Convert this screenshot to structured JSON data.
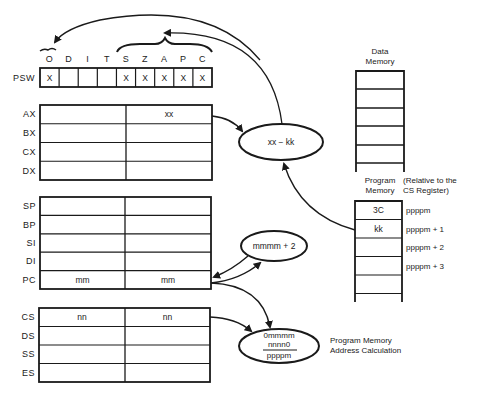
{
  "psw": {
    "label": "PSW",
    "flags": [
      {
        "name": "O",
        "value": "X"
      },
      {
        "name": "D",
        "value": ""
      },
      {
        "name": "I",
        "value": ""
      },
      {
        "name": "T",
        "value": ""
      },
      {
        "name": "S",
        "value": "X"
      },
      {
        "name": "Z",
        "value": "X"
      },
      {
        "name": "A",
        "value": "X"
      },
      {
        "name": "P",
        "value": "X"
      },
      {
        "name": "C",
        "value": "X"
      }
    ]
  },
  "general_registers": [
    {
      "name": "AX",
      "high": "",
      "low": "xx"
    },
    {
      "name": "BX",
      "high": "",
      "low": ""
    },
    {
      "name": "CX",
      "high": "",
      "low": ""
    },
    {
      "name": "DX",
      "high": "",
      "low": ""
    }
  ],
  "pointer_registers": [
    {
      "name": "SP",
      "high": "",
      "low": ""
    },
    {
      "name": "BP",
      "high": "",
      "low": ""
    },
    {
      "name": "SI",
      "high": "",
      "low": ""
    },
    {
      "name": "DI",
      "high": "",
      "low": ""
    },
    {
      "name": "PC",
      "high": "mm",
      "low": "mm"
    }
  ],
  "segment_registers": [
    {
      "name": "CS",
      "high": "nn",
      "low": "nn"
    },
    {
      "name": "DS",
      "high": "",
      "low": ""
    },
    {
      "name": "SS",
      "high": "",
      "low": ""
    },
    {
      "name": "ES",
      "high": "",
      "low": ""
    }
  ],
  "operations": {
    "subtract": "xx − kk",
    "increment": "mmmm + 2",
    "address_calc": {
      "line1": "0mmmm",
      "line2": "nnnn0",
      "result": "ppppm",
      "caption_line1": "Program Memory",
      "caption_line2": "Address Calculation"
    }
  },
  "data_memory": {
    "title_line1": "Data",
    "title_line2": "Memory"
  },
  "program_memory": {
    "title_line1": "Program",
    "title_line2": "Memory",
    "note_line1": "(Relative to the",
    "note_line2": "CS Register)",
    "cells": [
      {
        "value": "3C",
        "address": "ppppm"
      },
      {
        "value": "kk",
        "address": "ppppm + 1"
      },
      {
        "value": "",
        "address": "ppppm + 2"
      },
      {
        "value": "",
        "address": "ppppm + 3"
      },
      {
        "value": "",
        "address": ""
      }
    ]
  }
}
